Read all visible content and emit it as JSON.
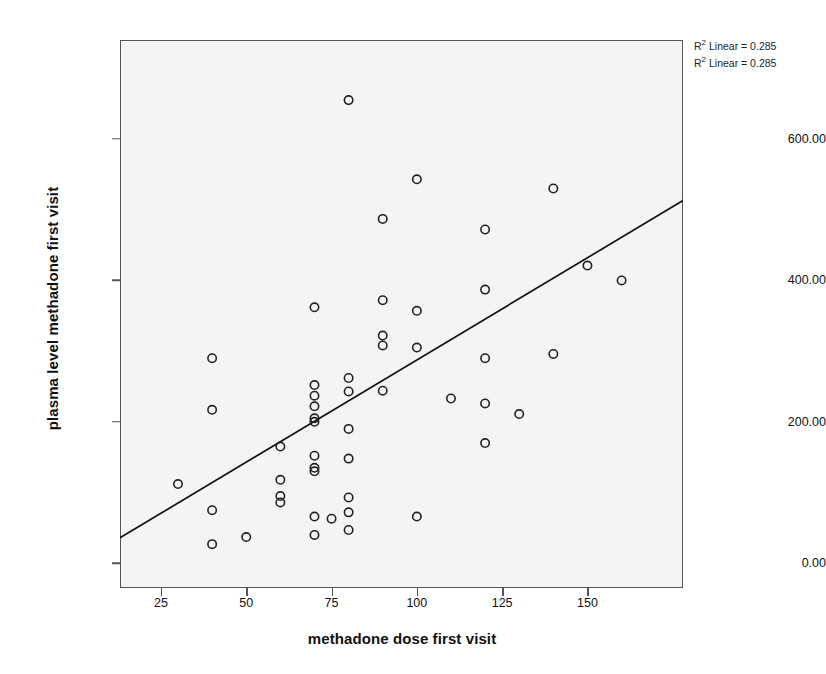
{
  "chart_data": {
    "type": "scatter",
    "title": "",
    "xlabel": "methadone dose first visit",
    "ylabel": "plasma level methadone first visit",
    "xlim": [
      13,
      178
    ],
    "ylim": [
      -35,
      740
    ],
    "grid": false,
    "xticks": [
      25,
      50,
      75,
      100,
      125,
      150
    ],
    "xtick_labels": [
      "25",
      "50",
      "75",
      "100",
      "125",
      "150"
    ],
    "yticks": [
      0,
      200,
      400,
      600
    ],
    "ytick_labels": [
      "0.00",
      "200.00",
      "400.00",
      "600.00"
    ],
    "annotations": [
      {
        "text": "R² Linear = 0.285",
        "superscript": "2",
        "prefix": "R",
        "suffix": " Linear = 0.285"
      },
      {
        "text": "R² Linear = 0.285",
        "superscript": "2",
        "prefix": "R",
        "suffix": " Linear = 0.285"
      }
    ],
    "fit_line": {
      "label": "linear fit",
      "x_start": 13,
      "y_start": 36,
      "x_end": 178,
      "y_end": 513,
      "r_squared": 0.285
    },
    "marker": {
      "shape": "open-circle",
      "radius": 4.2,
      "stroke": "#222222",
      "fill": "none"
    },
    "point_count": 57,
    "points": [
      {
        "x": 30,
        "y": 112
      },
      {
        "x": 40,
        "y": 290
      },
      {
        "x": 40,
        "y": 217
      },
      {
        "x": 40,
        "y": 75
      },
      {
        "x": 40,
        "y": 27
      },
      {
        "x": 50,
        "y": 37
      },
      {
        "x": 60,
        "y": 165
      },
      {
        "x": 60,
        "y": 118
      },
      {
        "x": 60,
        "y": 95
      },
      {
        "x": 60,
        "y": 86
      },
      {
        "x": 70,
        "y": 362
      },
      {
        "x": 70,
        "y": 252
      },
      {
        "x": 70,
        "y": 237
      },
      {
        "x": 70,
        "y": 222
      },
      {
        "x": 70,
        "y": 205
      },
      {
        "x": 70,
        "y": 200
      },
      {
        "x": 70,
        "y": 152
      },
      {
        "x": 70,
        "y": 135
      },
      {
        "x": 70,
        "y": 130
      },
      {
        "x": 70,
        "y": 66
      },
      {
        "x": 70,
        "y": 40
      },
      {
        "x": 75,
        "y": 63
      },
      {
        "x": 80,
        "y": 655
      },
      {
        "x": 80,
        "y": 262
      },
      {
        "x": 80,
        "y": 243
      },
      {
        "x": 80,
        "y": 190
      },
      {
        "x": 80,
        "y": 148
      },
      {
        "x": 80,
        "y": 93
      },
      {
        "x": 80,
        "y": 72
      },
      {
        "x": 80,
        "y": 47
      },
      {
        "x": 90,
        "y": 487
      },
      {
        "x": 90,
        "y": 372
      },
      {
        "x": 90,
        "y": 322
      },
      {
        "x": 90,
        "y": 308
      },
      {
        "x": 90,
        "y": 244
      },
      {
        "x": 100,
        "y": 543
      },
      {
        "x": 100,
        "y": 357
      },
      {
        "x": 100,
        "y": 305
      },
      {
        "x": 100,
        "y": 66
      },
      {
        "x": 110,
        "y": 233
      },
      {
        "x": 120,
        "y": 472
      },
      {
        "x": 120,
        "y": 387
      },
      {
        "x": 120,
        "y": 290
      },
      {
        "x": 120,
        "y": 226
      },
      {
        "x": 120,
        "y": 170
      },
      {
        "x": 130,
        "y": 211
      },
      {
        "x": 140,
        "y": 530
      },
      {
        "x": 140,
        "y": 296
      },
      {
        "x": 150,
        "y": 421
      },
      {
        "x": 160,
        "y": 400
      }
    ]
  }
}
